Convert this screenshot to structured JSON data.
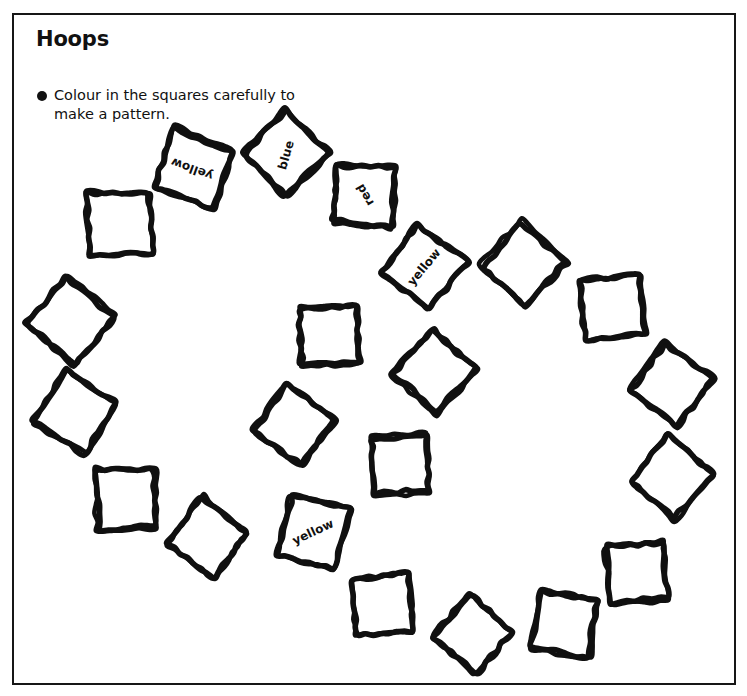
{
  "page": {
    "title": "Hoops",
    "instruction": "Colour in the squares carefully to make a pattern.",
    "bullet_icon": "bullet-dot-icon",
    "frame_color": "#161616",
    "ink_color": "#101010",
    "paper_color": "#ffffff"
  },
  "squares": [
    {
      "id": 1,
      "label": "yellow",
      "cx": 194,
      "cy": 169,
      "size": 62,
      "rot": 20,
      "label_rot": 200,
      "label_dx": -2,
      "label_dy": 0
    },
    {
      "id": 2,
      "label": "blue",
      "cx": 286,
      "cy": 153,
      "size": 60,
      "rot": 44,
      "label_rot": 286,
      "label_dx": 0,
      "label_dy": 2
    },
    {
      "id": 3,
      "label": "red",
      "cx": 365,
      "cy": 195,
      "size": 58,
      "rot": 5,
      "label_rot": 240,
      "label_dx": 0,
      "label_dy": 0
    },
    {
      "id": 4,
      "label": "yellow",
      "cx": 424,
      "cy": 267,
      "size": 60,
      "rot": 38,
      "label_rot": 310,
      "label_dx": 0,
      "label_dy": 0
    },
    {
      "id": 5,
      "label": "",
      "cx": 120,
      "cy": 224,
      "size": 61,
      "rot": -2,
      "label_rot": 0,
      "label_dx": 0,
      "label_dy": 0
    },
    {
      "id": 6,
      "label": "",
      "cx": 70,
      "cy": 320,
      "size": 62,
      "rot": 40,
      "label_rot": 0,
      "label_dx": 0,
      "label_dy": 0
    },
    {
      "id": 7,
      "label": "",
      "cx": 74,
      "cy": 412,
      "size": 60,
      "rot": 32,
      "label_rot": 0,
      "label_dx": 0,
      "label_dy": 0
    },
    {
      "id": 8,
      "label": "",
      "cx": 126,
      "cy": 498,
      "size": 58,
      "rot": -3,
      "label_rot": 0,
      "label_dx": 0,
      "label_dy": 0
    },
    {
      "id": 9,
      "label": "",
      "cx": 208,
      "cy": 538,
      "size": 58,
      "rot": 38,
      "label_rot": 0,
      "label_dx": 0,
      "label_dy": 0
    },
    {
      "id": 10,
      "label": "yellow",
      "cx": 313,
      "cy": 532,
      "size": 60,
      "rot": 14,
      "label_rot": 335,
      "label_dx": 0,
      "label_dy": 0
    },
    {
      "id": 11,
      "label": "",
      "cx": 383,
      "cy": 605,
      "size": 58,
      "rot": -5,
      "label_rot": 0,
      "label_dx": 0,
      "label_dy": 0
    },
    {
      "id": 12,
      "label": "",
      "cx": 473,
      "cy": 635,
      "size": 56,
      "rot": 42,
      "label_rot": 0,
      "label_dx": 0,
      "label_dy": 0
    },
    {
      "id": 13,
      "label": "",
      "cx": 565,
      "cy": 624,
      "size": 58,
      "rot": 10,
      "label_rot": 0,
      "label_dx": 0,
      "label_dy": 0
    },
    {
      "id": 14,
      "label": "",
      "cx": 638,
      "cy": 573,
      "size": 57,
      "rot": -6,
      "label_rot": 0,
      "label_dx": 0,
      "label_dy": 0
    },
    {
      "id": 15,
      "label": "",
      "cx": 672,
      "cy": 477,
      "size": 58,
      "rot": 40,
      "label_rot": 0,
      "label_dx": 0,
      "label_dy": 0
    },
    {
      "id": 16,
      "label": "",
      "cx": 672,
      "cy": 385,
      "size": 60,
      "rot": 37,
      "label_rot": 0,
      "label_dx": 0,
      "label_dy": 0
    },
    {
      "id": 17,
      "label": "",
      "cx": 613,
      "cy": 307,
      "size": 60,
      "rot": -6,
      "label_rot": 0,
      "label_dx": 0,
      "label_dy": 0
    },
    {
      "id": 18,
      "label": "",
      "cx": 523,
      "cy": 264,
      "size": 60,
      "rot": 41,
      "label_rot": 0,
      "label_dx": 0,
      "label_dy": 0
    },
    {
      "id": 19,
      "label": "",
      "cx": 329,
      "cy": 335,
      "size": 58,
      "rot": -3,
      "label_rot": 0,
      "label_dx": 0,
      "label_dy": 0
    },
    {
      "id": 20,
      "label": "",
      "cx": 435,
      "cy": 372,
      "size": 58,
      "rot": 42,
      "label_rot": 0,
      "label_dx": 0,
      "label_dy": 0
    },
    {
      "id": 21,
      "label": "",
      "cx": 294,
      "cy": 425,
      "size": 58,
      "rot": 36,
      "label_rot": 0,
      "label_dx": 0,
      "label_dy": 0
    },
    {
      "id": 22,
      "label": "",
      "cx": 400,
      "cy": 465,
      "size": 56,
      "rot": -4,
      "label_rot": 0,
      "label_dx": 0,
      "label_dy": 0
    }
  ]
}
